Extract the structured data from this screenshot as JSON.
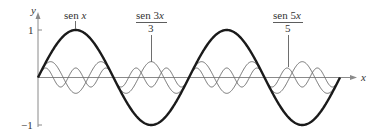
{
  "figure": {
    "axis_x_label": "x",
    "axis_y_label": "y",
    "tick_y_top": "1",
    "tick_y_bottom": "−1",
    "label_sin_x": {
      "prefix": "sen ",
      "var": "x"
    },
    "label_sin_3x": {
      "numerator_prefix": "sen 3",
      "numerator_var": "x",
      "denominator": "3"
    },
    "label_sin_5x": {
      "numerator_prefix": "sen 5",
      "numerator_var": "x",
      "denominator": "5"
    },
    "colors": {
      "main_curve": "#1a1a1a",
      "harmonics": "#6e6e6e",
      "axes": "#8a8a8a",
      "text": "#333333"
    }
  },
  "chart_data": {
    "type": "line",
    "title": "",
    "xlabel": "x",
    "ylabel": "y",
    "x_range": [
      0,
      12.566
    ],
    "ylim": [
      -1,
      1
    ],
    "yticks": [
      -1,
      1
    ],
    "grid": false,
    "series": [
      {
        "name": "sen x",
        "function": "sin(x)",
        "amplitude": 1,
        "period": 6.2832,
        "style": "thick dark"
      },
      {
        "name": "sen 3x / 3",
        "function": "sin(3x)/3",
        "amplitude": 0.3333,
        "period": 2.0944,
        "style": "thin gray"
      },
      {
        "name": "sen 5x / 5",
        "function": "sin(5x)/5",
        "amplitude": 0.2,
        "period": 1.2566,
        "style": "thin gray"
      }
    ]
  }
}
